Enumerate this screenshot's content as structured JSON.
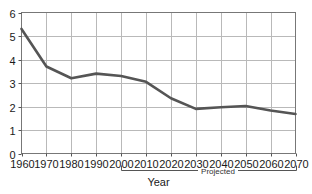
{
  "chart_data": {
    "type": "line",
    "title": "",
    "subtitle": "",
    "xlabel": "Year",
    "ylabel": "",
    "xlim": [
      1960,
      2070
    ],
    "ylim": [
      0,
      6
    ],
    "grid": true,
    "legend": null,
    "x": [
      1960,
      1970,
      1980,
      1990,
      2000,
      2010,
      2020,
      2030,
      2040,
      2050,
      2060,
      2070
    ],
    "xtick_labels": [
      "1960",
      "1970",
      "1980",
      "1990",
      "2000",
      "2010",
      "2020",
      "2030",
      "2040",
      "2050",
      "2060",
      "2070"
    ],
    "ytick_labels": [
      "0",
      "1",
      "2",
      "3",
      "4",
      "5",
      "6"
    ],
    "ytick_values": [
      0,
      1,
      2,
      3,
      4,
      5,
      6
    ],
    "series": [
      {
        "name": "",
        "color": "#555555",
        "values": [
          5.3,
          3.7,
          3.2,
          3.4,
          3.3,
          3.05,
          2.35,
          1.9,
          1.97,
          2.02,
          1.83,
          1.68
        ]
      }
    ],
    "annotations": [
      {
        "name": "projected-bracket",
        "label": "Projected",
        "x_start": 2000,
        "x_end": 2070
      },
      {
        "name": "year-bracket",
        "label": "Year",
        "x_start": 2000,
        "x_end": 2070
      }
    ],
    "colors": {
      "line": "#555555",
      "grid": "#b9b9b9",
      "axis": "#555555",
      "text": "#1a1a1a",
      "background": "#ffffff"
    }
  }
}
